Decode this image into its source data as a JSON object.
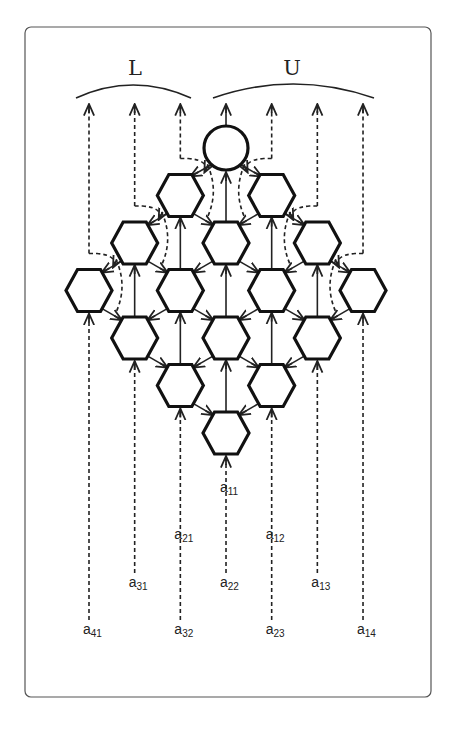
{
  "diagram": {
    "groups": [
      {
        "id": "L",
        "label": "L",
        "outputs": [
          0,
          1,
          2
        ]
      },
      {
        "id": "U",
        "label": "U",
        "outputs": [
          3,
          4,
          5,
          6
        ]
      }
    ],
    "circle_node": {
      "row": 0,
      "col": 3
    },
    "hex_nodes": [
      {
        "row": 1,
        "col": 2
      },
      {
        "row": 1,
        "col": 4
      },
      {
        "row": 2,
        "col": 1
      },
      {
        "row": 2,
        "col": 3
      },
      {
        "row": 2,
        "col": 5
      },
      {
        "row": 3,
        "col": 0
      },
      {
        "row": 3,
        "col": 2
      },
      {
        "row": 3,
        "col": 4
      },
      {
        "row": 3,
        "col": 6
      },
      {
        "row": 4,
        "col": 1
      },
      {
        "row": 4,
        "col": 3
      },
      {
        "row": 4,
        "col": 5
      },
      {
        "row": 5,
        "col": 2
      },
      {
        "row": 5,
        "col": 4
      },
      {
        "row": 6,
        "col": 3
      }
    ],
    "inputs": [
      {
        "base": "a",
        "sub": "11",
        "col": 3,
        "level": 0
      },
      {
        "base": "a",
        "sub": "21",
        "col": 2,
        "level": 1
      },
      {
        "base": "a",
        "sub": "12",
        "col": 4,
        "level": 1
      },
      {
        "base": "a",
        "sub": "31",
        "col": 1,
        "level": 2
      },
      {
        "base": "a",
        "sub": "22",
        "col": 3,
        "level": 2
      },
      {
        "base": "a",
        "sub": "13",
        "col": 5,
        "level": 2
      },
      {
        "base": "a",
        "sub": "41",
        "col": 0,
        "level": 3
      },
      {
        "base": "a",
        "sub": "32",
        "col": 2,
        "level": 3
      },
      {
        "base": "a",
        "sub": "23",
        "col": 4,
        "level": 3
      },
      {
        "base": "a",
        "sub": "14",
        "col": 6,
        "level": 3
      }
    ]
  }
}
